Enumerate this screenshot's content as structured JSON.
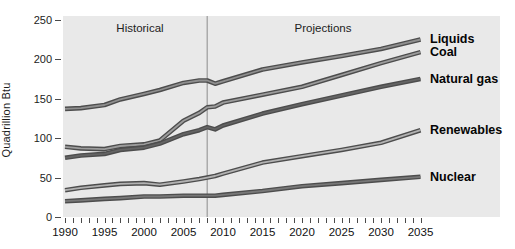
{
  "figure": {
    "panel_background": "#e9e9e9",
    "annotations": {
      "historical": "Historical",
      "projections": "Projections"
    },
    "divider_year": 2008,
    "colors": {
      "line_outer": "#4d4d4d",
      "divider": "#9b9b9b",
      "tick": "#4a4a4a",
      "text": "#1c1c1c"
    }
  },
  "chart_data": {
    "type": "line",
    "title": "",
    "xlabel": "",
    "ylabel": "Quadrillion Btu",
    "xlim": [
      1990,
      2035
    ],
    "ylim": [
      0,
      250
    ],
    "grid": false,
    "legend_position": "right-of-line-ends",
    "y_ticks": [
      250,
      200,
      150,
      100,
      50,
      0
    ],
    "x_label_ticks": [
      1990,
      1995,
      2000,
      2005,
      2010,
      2015,
      2020,
      2025,
      2030,
      2035
    ],
    "x_minor_tick_step": 1,
    "x": [
      1990,
      1992,
      1995,
      1997,
      2000,
      2002,
      2005,
      2007,
      2008,
      2009,
      2010,
      2015,
      2020,
      2025,
      2030,
      2035
    ],
    "series": [
      {
        "name": "Liquids",
        "color": "#8f8f8f",
        "values": [
          137,
          138,
          142,
          149,
          156,
          161,
          170,
          173,
          173,
          169,
          172,
          187,
          196,
          204,
          213,
          225
        ]
      },
      {
        "name": "Coal",
        "color": "#9c9c9c",
        "values": [
          89,
          87,
          86,
          90,
          92,
          97,
          122,
          132,
          139,
          140,
          145,
          155,
          165,
          180,
          195,
          209
        ]
      },
      {
        "name": "Natural gas",
        "color": "#646464",
        "values": [
          75,
          78,
          80,
          85,
          88,
          93,
          105,
          110,
          114,
          111,
          116,
          131,
          143,
          154,
          165,
          175
        ]
      },
      {
        "name": "Renewables",
        "color": "#b2b2b2",
        "values": [
          34,
          37,
          40,
          42,
          43,
          41,
          45,
          48,
          50,
          52,
          55,
          69,
          77,
          85,
          94,
          110
        ]
      },
      {
        "name": "Nuclear",
        "color": "#787878",
        "values": [
          20,
          21,
          23,
          24,
          26,
          26,
          27,
          27,
          27,
          27,
          28,
          33,
          39,
          43,
          47,
          51
        ]
      }
    ]
  }
}
